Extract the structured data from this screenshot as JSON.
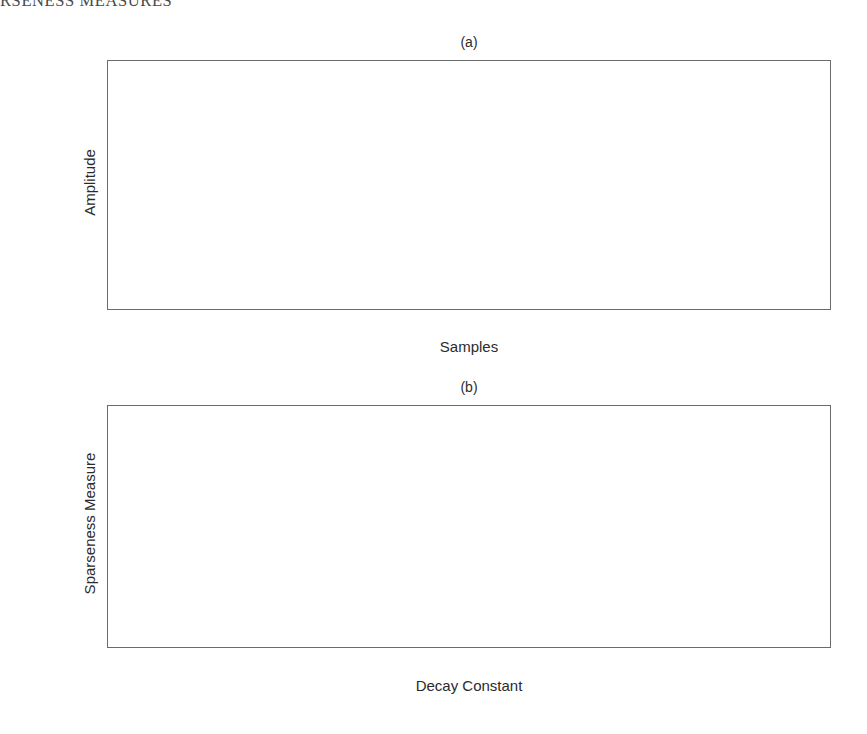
{
  "header": {
    "running_title": "RSENESS MEASURES"
  },
  "figure": {
    "panels": [
      {
        "id": "a",
        "title": "(a)",
        "xlabel": "Samples",
        "ylabel": "Amplitude"
      },
      {
        "id": "b",
        "title": "(b)",
        "xlabel": "Decay Constant",
        "ylabel": "Sparseness Measure"
      }
    ]
  },
  "chart_data": [
    {
      "type": "line",
      "panel": "a",
      "title": "(a)",
      "xlabel": "Samples",
      "ylabel": "Amplitude",
      "xlim": [
        1,
        256
      ],
      "ylim": [
        0,
        1
      ],
      "xticks": [
        50,
        100,
        150,
        200,
        250
      ],
      "xticklabels": [
        "50",
        "100",
        "150",
        "200",
        "250"
      ],
      "yticks": [
        0,
        0.2,
        0.4,
        0.6,
        0.8,
        1
      ],
      "yticklabels": [
        "0",
        "0.2",
        "0.4",
        "0.6",
        "0.8",
        "1"
      ],
      "grid": true,
      "legend": "none",
      "description": "Family of 100 exponentially decaying envelopes exp(-n/tau) plotted over n = 1..256 samples, one curve per decay constant tau = 1..100. All curves start at amplitude 1 and the slowest (tau = 100) forms the upper envelope which falls to about 0.08 at sample 256.",
      "series_generator": {
        "formula": "y = exp(-(n-1)/tau)",
        "n_from": 1,
        "n_to": 256,
        "tau_from": 1,
        "tau_to": 100,
        "tau_step": 1,
        "curve_count": 100
      },
      "envelope_upper": {
        "name": "tau = 100",
        "x": [
          1,
          25,
          50,
          75,
          100,
          125,
          150,
          175,
          200,
          225,
          250,
          256
        ],
        "y": [
          1.0,
          0.79,
          0.61,
          0.48,
          0.37,
          0.29,
          0.23,
          0.18,
          0.14,
          0.11,
          0.085,
          0.08
        ]
      },
      "envelope_lower": {
        "name": "tau = 1",
        "x": [
          1,
          2,
          3,
          5,
          10,
          50,
          256
        ],
        "y": [
          1.0,
          0.37,
          0.14,
          0.018,
          0.0001,
          0.0,
          0.0
        ]
      }
    },
    {
      "type": "line",
      "panel": "b",
      "title": "(b)",
      "xlabel": "Decay Constant",
      "ylabel": "Sparseness Measure",
      "xlim": [
        1,
        100
      ],
      "ylim": [
        0,
        1
      ],
      "xticks": [
        10,
        20,
        30,
        40,
        50,
        60,
        70,
        80,
        90,
        100
      ],
      "xticklabels": [
        "10",
        "20",
        "30",
        "40",
        "50",
        "60",
        "70",
        "80",
        "90",
        "100"
      ],
      "yticks": [
        0,
        0.2,
        0.4,
        0.6,
        0.8,
        1
      ],
      "yticklabels": [
        "0",
        "0.2",
        "0.4",
        "0.6",
        "0.8",
        "1"
      ],
      "grid": true,
      "legend": "none",
      "description": "Sparseness measure of each exponentially decaying signal plotted against its decay constant. Decreases almost linearly from 1.0 at a decay constant of 1 down to about 0.64 at a decay constant of 100.",
      "series": [
        {
          "name": "Sparseness Measure",
          "x": [
            1,
            5,
            10,
            15,
            20,
            25,
            30,
            35,
            40,
            45,
            50,
            55,
            60,
            65,
            70,
            75,
            80,
            85,
            90,
            95,
            100
          ],
          "y": [
            1.0,
            0.985,
            0.966,
            0.947,
            0.928,
            0.909,
            0.89,
            0.871,
            0.852,
            0.833,
            0.814,
            0.795,
            0.776,
            0.757,
            0.738,
            0.719,
            0.7,
            0.682,
            0.666,
            0.652,
            0.64
          ]
        }
      ]
    }
  ],
  "colors": {
    "axis": "#6b6b6b",
    "grid": "#b9b9b9",
    "curve": "#1a1a1a",
    "text": "#2b2b2b",
    "background": "#ffffff"
  }
}
